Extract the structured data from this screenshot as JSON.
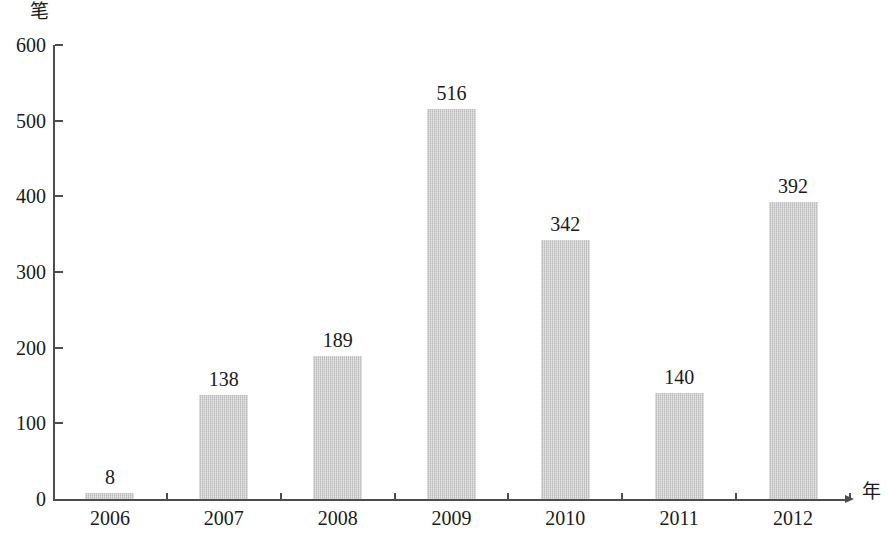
{
  "chart_data": {
    "type": "bar",
    "title": "",
    "subtitle": "",
    "xlabel": "年",
    "ylabel": "笔",
    "categories": [
      "2006",
      "2007",
      "2008",
      "2009",
      "2010",
      "2011",
      "2012"
    ],
    "values": [
      8,
      138,
      189,
      516,
      342,
      140,
      392
    ],
    "value_labels": [
      "8",
      "138",
      "189",
      "516",
      "342",
      "140",
      "392"
    ],
    "ylim": [
      0,
      600
    ],
    "y_ticks": [
      0,
      100,
      200,
      300,
      400,
      500,
      600
    ],
    "y_tick_labels": [
      "0",
      "100",
      "200",
      "300",
      "400",
      "500",
      "600"
    ],
    "grid": false,
    "legend": null,
    "legend_position": "none",
    "series": [
      {
        "name": "",
        "values": [
          8,
          138,
          189,
          516,
          342,
          140,
          392
        ],
        "color": "#c9c9c9"
      }
    ],
    "bar_color": "#c9c9c9",
    "axis_color": "#4d4d4d",
    "text_color": "#1a1a1a"
  },
  "axes": {
    "y_unit": "笔",
    "x_unit": "年"
  }
}
